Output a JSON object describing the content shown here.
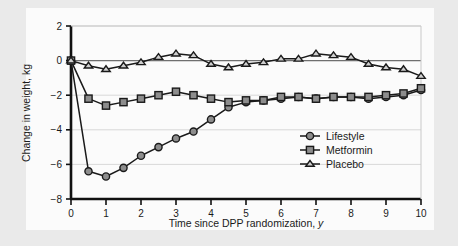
{
  "chart_data": {
    "type": "line",
    "title": "",
    "xlabel": "Time since DPP randomization, y",
    "ylabel": "Change in weight, kg",
    "xlim": [
      0,
      10
    ],
    "ylim": [
      -8,
      2
    ],
    "xticks": [
      "0",
      "1",
      "2",
      "3",
      "4",
      "5",
      "6",
      "7",
      "8",
      "9",
      "10"
    ],
    "yticks": [
      "2",
      "0",
      "−2",
      "−4",
      "−6",
      "−8"
    ],
    "grid": true,
    "legend_position": "inside-right",
    "series": [
      {
        "name": "Lifestyle",
        "marker": "circle",
        "color": "#8d8d8d",
        "x": [
          0,
          0.5,
          1,
          1.5,
          2,
          2.5,
          3,
          3.5,
          4,
          4.5,
          5,
          5.5,
          6,
          6.5,
          7,
          7.5,
          8,
          8.5,
          9,
          9.5,
          10
        ],
        "values": [
          0,
          -6.4,
          -6.7,
          -6.2,
          -5.5,
          -5.0,
          -4.5,
          -4.1,
          -3.4,
          -2.7,
          -2.4,
          -2.3,
          -2.2,
          -2.1,
          -2.2,
          -2.1,
          -2.1,
          -2.2,
          -2.1,
          -2.0,
          -1.7
        ]
      },
      {
        "name": "Metformin",
        "marker": "square",
        "color": "#8d8d8d",
        "x": [
          0,
          0.5,
          1,
          1.5,
          2,
          2.5,
          3,
          3.5,
          4,
          4.5,
          5,
          5.5,
          6,
          6.5,
          7,
          7.5,
          8,
          8.5,
          9,
          9.5,
          10
        ],
        "values": [
          0,
          -2.2,
          -2.6,
          -2.4,
          -2.2,
          -2.0,
          -1.8,
          -2.0,
          -2.2,
          -2.4,
          -2.3,
          -2.3,
          -2.1,
          -2.1,
          -2.2,
          -2.1,
          -2.1,
          -2.1,
          -2.0,
          -1.9,
          -1.6
        ]
      },
      {
        "name": "Placebo",
        "marker": "triangle",
        "color": "#cfcfcf",
        "x": [
          0,
          0.5,
          1,
          1.5,
          2,
          2.5,
          3,
          3.5,
          4,
          4.5,
          5,
          5.5,
          6,
          6.5,
          7,
          7.5,
          8,
          8.5,
          9,
          9.5,
          10
        ],
        "values": [
          0,
          -0.3,
          -0.5,
          -0.3,
          -0.1,
          0.2,
          0.4,
          0.3,
          -0.2,
          -0.4,
          -0.2,
          -0.1,
          0.1,
          0.1,
          0.4,
          0.3,
          0.2,
          -0.2,
          -0.4,
          -0.5,
          -0.9
        ]
      }
    ]
  },
  "legend": {
    "items": [
      {
        "label": "Lifestyle",
        "marker": "circle-marker"
      },
      {
        "label": "Metformin",
        "marker": "square-marker"
      },
      {
        "label": "Placebo",
        "marker": "triangle-marker"
      }
    ]
  }
}
